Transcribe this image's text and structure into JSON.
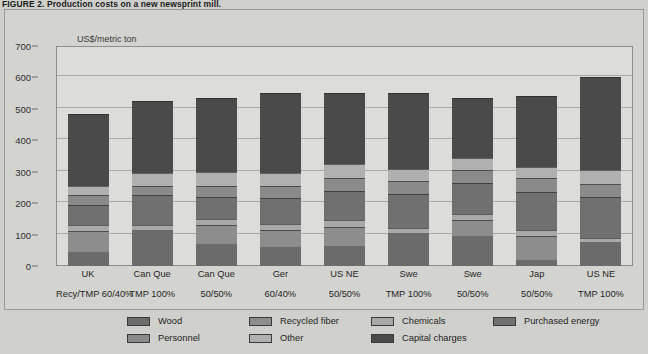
{
  "figure": {
    "caption_number": "FIGURE 2.",
    "caption_text": "Production costs on a new newsprint mill."
  },
  "chart_data": {
    "type": "bar",
    "subtype": "stacked-vertical",
    "title": "Production costs on a new newsprint mill.",
    "axis_unit_label": "US$/metric ton",
    "xlabel": "",
    "ylabel": "US$/metric ton",
    "ylim": [
      0,
      700
    ],
    "yticks": [
      0,
      100,
      200,
      300,
      400,
      500,
      600,
      700
    ],
    "grid": true,
    "legend_position": "bottom",
    "categories": [
      "UK Recy/TMP 60/40%",
      "Can Que TMP 100%",
      "Can Que 50/50%",
      "Ger 60/40%",
      "US NE 50/50%",
      "Swe TMP 100%",
      "Swe 50/50%",
      "Jap 50/50%",
      "US NE TMP 100%"
    ],
    "category_lines": [
      {
        "line1": "UK",
        "line2": "Recy/TMP 60/40%"
      },
      {
        "line1": "Can Que",
        "line2": "TMP 100%"
      },
      {
        "line1": "Can Que",
        "line2": "50/50%"
      },
      {
        "line1": "Ger",
        "line2": "60/40%"
      },
      {
        "line1": "US NE",
        "line2": "50/50%"
      },
      {
        "line1": "Swe",
        "line2": "TMP 100%"
      },
      {
        "line1": "Swe",
        "line2": "50/50%"
      },
      {
        "line1": "Jap",
        "line2": "50/50%"
      },
      {
        "line1": "US NE",
        "line2": "TMP 100%"
      }
    ],
    "series": [
      {
        "name": "Wood",
        "color": "#6b6b6b",
        "values": [
          45,
          115,
          70,
          60,
          65,
          105,
          95,
          20,
          75
        ]
      },
      {
        "name": "Recycled fiber",
        "color": "#8d8d8d",
        "values": [
          65,
          0,
          60,
          55,
          60,
          0,
          50,
          75,
          0
        ]
      },
      {
        "name": "Chemicals",
        "color": "#a8a8a8",
        "values": [
          20,
          15,
          20,
          20,
          20,
          15,
          20,
          20,
          15
        ]
      },
      {
        "name": "Purchased energy",
        "color": "#707070",
        "values": [
          65,
          95,
          70,
          80,
          95,
          110,
          100,
          120,
          130
        ]
      },
      {
        "name": "Personnel",
        "color": "#8a8a8a",
        "values": [
          30,
          30,
          35,
          40,
          40,
          40,
          40,
          45,
          40
        ]
      },
      {
        "name": "Other",
        "color": "#b0b0b0",
        "values": [
          30,
          40,
          45,
          40,
          45,
          40,
          40,
          35,
          45
        ]
      },
      {
        "name": "Capital charges",
        "color": "#4a4a4a",
        "values": [
          230,
          230,
          235,
          255,
          225,
          240,
          190,
          225,
          295
        ]
      }
    ],
    "totals": [
      485,
      525,
      535,
      550,
      550,
      550,
      535,
      540,
      600
    ]
  },
  "legend": {
    "items": [
      {
        "label": "Wood",
        "color": "#6b6b6b"
      },
      {
        "label": "Personnel",
        "color": "#8a8a8a"
      },
      {
        "label": "Recycled fiber",
        "color": "#8d8d8d"
      },
      {
        "label": "Other",
        "color": "#b0b0b0"
      },
      {
        "label": "Chemicals",
        "color": "#a8a8a8"
      },
      {
        "label": "Capital charges",
        "color": "#4a4a4a"
      },
      {
        "label": "Purchased energy",
        "color": "#707070"
      }
    ]
  }
}
